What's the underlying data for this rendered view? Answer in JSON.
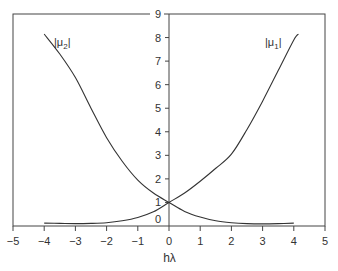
{
  "chart_data": {
    "type": "line",
    "title": "",
    "xlabel": "hλ",
    "ylabel": "",
    "xlim": [
      -5,
      5
    ],
    "ylim": [
      0,
      9
    ],
    "grid": false,
    "legend": "inline labels",
    "x_ticks": [
      -5,
      -4,
      -3,
      -2,
      -1,
      0,
      1,
      2,
      3,
      4,
      5
    ],
    "x_tick_labels": [
      "−5",
      "−4",
      "−3",
      "−2",
      "−1",
      "0",
      "1",
      "2",
      "3",
      "4",
      "5"
    ],
    "y_ticks": [
      0,
      1,
      2,
      3,
      4,
      5,
      6,
      7,
      8,
      9
    ],
    "y_tick_labels": [
      "0",
      "1",
      "2",
      "3",
      "4",
      "5",
      "6",
      "7",
      "8",
      "9"
    ],
    "series": [
      {
        "name": "|μ1|",
        "label_main": "|μ",
        "label_sub": "1",
        "label_end": "|",
        "x": [
          -4,
          -3.5,
          -3,
          -2.5,
          -2,
          -1.5,
          -1,
          -0.5,
          0,
          0.5,
          1,
          1.5,
          2,
          2.5,
          3,
          3.5,
          4,
          4.15
        ],
        "values": [
          0.12,
          0.11,
          0.1,
          0.11,
          0.14,
          0.22,
          0.36,
          0.6,
          1.0,
          1.4,
          1.9,
          2.45,
          3.05,
          4.1,
          5.3,
          6.6,
          7.9,
          8.15
        ]
      },
      {
        "name": "|μ2|",
        "label_main": "|μ",
        "label_sub": "2",
        "label_end": "|",
        "x": [
          -4,
          -3.5,
          -3,
          -2.5,
          -2,
          -1.5,
          -1,
          -0.5,
          0,
          0.5,
          1,
          1.5,
          2,
          2.5,
          3,
          3.5,
          4
        ],
        "values": [
          8.15,
          7.3,
          6.3,
          5.0,
          3.75,
          2.75,
          1.95,
          1.4,
          1.0,
          0.62,
          0.38,
          0.22,
          0.14,
          0.1,
          0.09,
          0.1,
          0.12
        ]
      }
    ]
  }
}
